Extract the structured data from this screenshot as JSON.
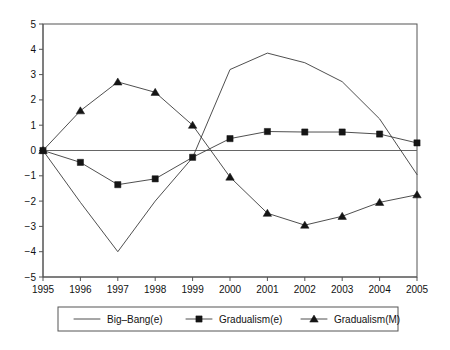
{
  "chart_data": {
    "type": "line",
    "title": "",
    "xlabel": "",
    "ylabel": "",
    "x": [
      1995,
      1996,
      1997,
      1998,
      1999,
      2000,
      2001,
      2002,
      2003,
      2004,
      2005
    ],
    "categories": [
      "1995",
      "1996",
      "1997",
      "1998",
      "1999",
      "2000",
      "2001",
      "2002",
      "2003",
      "2004",
      "2005"
    ],
    "xtick_labels": [
      "1995",
      "1996",
      "1997",
      "1998",
      "1999",
      "2000",
      "2001",
      "2002",
      "2003",
      "2004",
      "2005"
    ],
    "ytick_labels": [
      "5",
      "4",
      "3",
      "2",
      "1",
      "0",
      "-1",
      "-2",
      "-3",
      "-4",
      "-5"
    ],
    "yticks": [
      5,
      4,
      3,
      2,
      1,
      0,
      -1,
      -2,
      -3,
      -4,
      -5
    ],
    "ylim": [
      -5,
      5
    ],
    "xlim": [
      1995,
      2005
    ],
    "grid": false,
    "zero_line": true,
    "legend_position": "bottom",
    "series": [
      {
        "name": "Big-Bang(e)",
        "marker": "none",
        "color": "#3b3b3b",
        "values": [
          0.0,
          -2.05,
          -4.0,
          -2.0,
          -0.28,
          3.2,
          3.85,
          3.47,
          2.72,
          1.25,
          -0.95
        ]
      },
      {
        "name": "Gradualism(e)",
        "marker": "square",
        "color": "#151515",
        "values": [
          0.0,
          -0.47,
          -1.35,
          -1.12,
          -0.27,
          0.47,
          0.75,
          0.73,
          0.73,
          0.65,
          0.3
        ]
      },
      {
        "name": "Gradualism(M)",
        "marker": "triangle",
        "color": "#151515",
        "values": [
          0.0,
          1.57,
          2.71,
          2.3,
          1.0,
          -1.05,
          -2.48,
          -2.95,
          -2.6,
          -2.05,
          -1.75
        ]
      }
    ]
  },
  "legend": {
    "entries": [
      {
        "label": "Big-Bang(e)",
        "marker": "none"
      },
      {
        "label": "Gradualism(e)",
        "marker": "square"
      },
      {
        "label": "Gradualism(M)",
        "marker": "triangle"
      }
    ]
  }
}
